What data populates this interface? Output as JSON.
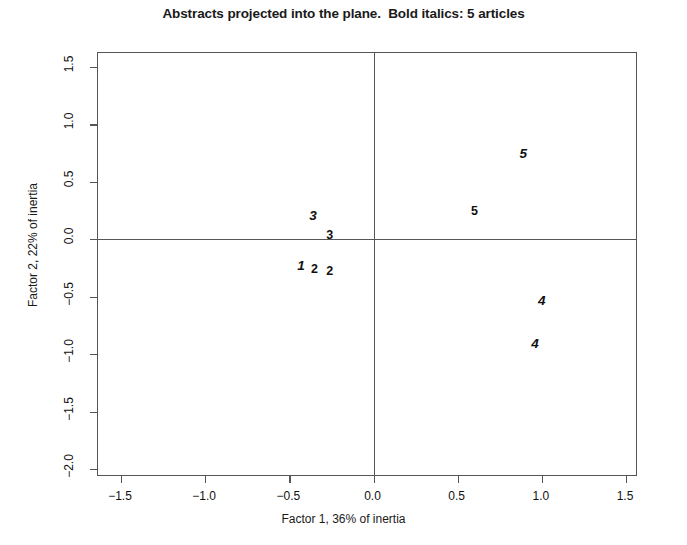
{
  "chart_data": {
    "type": "scatter",
    "title": "Abstracts projected into the plane.  Bold italics: 5 articles",
    "xlabel": "Factor 1, 36% of inertia",
    "ylabel": "Factor 2, 22% of inertia",
    "xlim": [
      -1.5,
      1.5
    ],
    "ylim": [
      -2.0,
      1.5
    ],
    "xticks": [
      "-1.5",
      "-1.0",
      "-0.5",
      "0.0",
      "0.5",
      "1.0",
      "1.5"
    ],
    "xtick_values": [
      -1.5,
      -1.0,
      -0.5,
      0.0,
      0.5,
      1.0,
      1.5
    ],
    "yticks": [
      "1.5",
      "1.0",
      "0.5",
      "0.0",
      "-0.5",
      "-1.0",
      "-1.5",
      "-2.0"
    ],
    "ytick_values": [
      1.5,
      1.0,
      0.5,
      0.0,
      -0.5,
      -1.0,
      -1.5,
      -2.0
    ],
    "grid": false,
    "legend": null,
    "reference_lines": [
      {
        "type": "vertical",
        "value": 0.0
      },
      {
        "type": "horizontal",
        "value": 0.0
      }
    ],
    "annotations": [
      {
        "label": "3",
        "x": -0.36,
        "y": 0.2,
        "style": "bold-italic"
      },
      {
        "label": "3",
        "x": -0.26,
        "y": 0.04,
        "style": "bold"
      },
      {
        "label": "1",
        "x": -0.43,
        "y": -0.23,
        "style": "bold-italic"
      },
      {
        "label": "2",
        "x": -0.35,
        "y": -0.26,
        "style": "bold"
      },
      {
        "label": "2",
        "x": -0.26,
        "y": -0.28,
        "style": "bold"
      },
      {
        "label": "5",
        "x": 0.89,
        "y": 0.74,
        "style": "bold-italic"
      },
      {
        "label": "5",
        "x": 0.6,
        "y": 0.25,
        "style": "bold"
      },
      {
        "label": "4",
        "x": 1.0,
        "y": -0.54,
        "style": "bold-italic"
      },
      {
        "label": "4",
        "x": 0.96,
        "y": -0.91,
        "style": "bold-italic"
      }
    ],
    "series": [
      {
        "name": "5 articles (bold italics)",
        "points": [
          {
            "label": "3",
            "x": -0.36,
            "y": 0.2
          },
          {
            "label": "1",
            "x": -0.43,
            "y": -0.23
          },
          {
            "label": "5",
            "x": 0.89,
            "y": 0.74
          },
          {
            "label": "4",
            "x": 1.0,
            "y": -0.54
          },
          {
            "label": "4",
            "x": 0.96,
            "y": -0.91
          }
        ]
      },
      {
        "name": "other articles",
        "points": [
          {
            "label": "3",
            "x": -0.26,
            "y": 0.04
          },
          {
            "label": "2",
            "x": -0.35,
            "y": -0.26
          },
          {
            "label": "2",
            "x": -0.26,
            "y": -0.28
          },
          {
            "label": "5",
            "x": 0.6,
            "y": 0.25
          }
        ]
      }
    ]
  },
  "colors": {
    "axis": "#555555",
    "text": "#111111",
    "background": "#ffffff"
  }
}
